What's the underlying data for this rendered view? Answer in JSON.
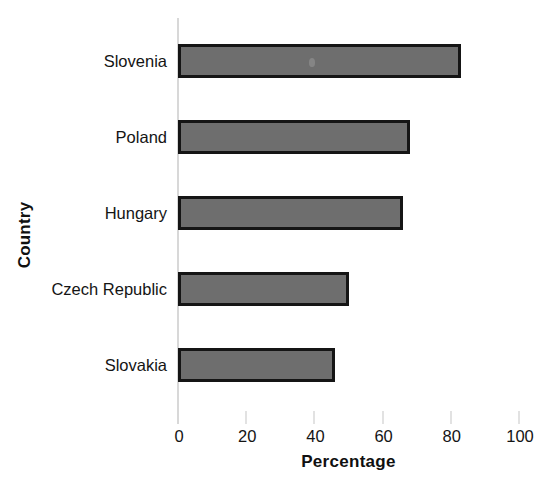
{
  "chart_data": {
    "type": "bar",
    "orientation": "horizontal",
    "title": "",
    "xlabel": "Percentage",
    "ylabel": "Country",
    "categories": [
      "Slovenia",
      "Poland",
      "Hungary",
      "Czech Republic",
      "Slovakia"
    ],
    "values": [
      83,
      68,
      66,
      50,
      46
    ],
    "xlim": [
      0,
      100
    ],
    "xticks": [
      "0",
      "20",
      "40",
      "60",
      "80",
      "100"
    ],
    "xtick_values": [
      0,
      20,
      40,
      60,
      80,
      100
    ],
    "grid": false,
    "legend": false,
    "series": [
      {
        "name": "Percentage",
        "values": [
          83,
          68,
          66,
          50,
          46
        ]
      }
    ],
    "colors": {
      "bar_fill": "#6e6e6e",
      "bar_border": "#151515",
      "axis_line": "#d8d8d8",
      "text": "#141414",
      "background": "#ffffff"
    }
  }
}
